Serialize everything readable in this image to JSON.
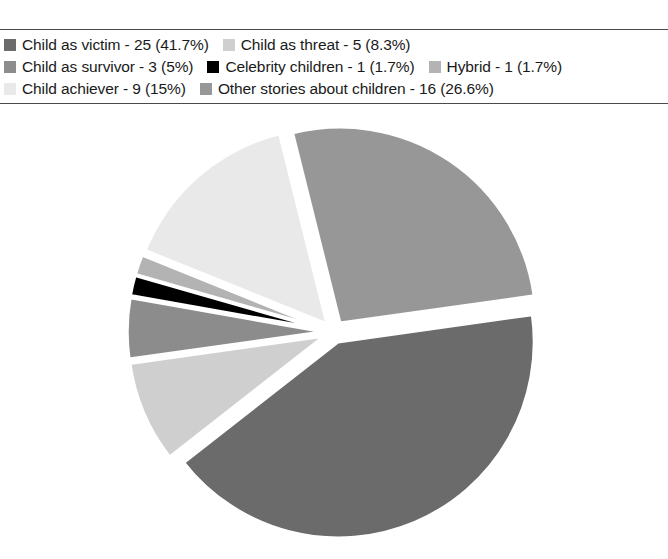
{
  "chart_data": {
    "type": "pie",
    "title": "",
    "subtitle": "",
    "xlabel": "",
    "ylabel": "",
    "legend_position": "top",
    "grid": false,
    "total": 60,
    "exploded": true,
    "start_angle_deg": -8,
    "categories": [
      "Child as victim",
      "Child as threat",
      "Child as survivor",
      "Celebrity children",
      "Hybrid",
      "Child achiever",
      "Other stories about children"
    ],
    "values": [
      25,
      5,
      3,
      1,
      1,
      9,
      16
    ],
    "percentages": [
      41.7,
      8.3,
      5.0,
      1.7,
      1.7,
      15.0,
      26.6
    ],
    "colors": [
      "#6b6b6b",
      "#cfcfcf",
      "#8c8c8c",
      "#000000",
      "#b3b3b3",
      "#e9e9e9",
      "#979797"
    ],
    "slices": [
      {
        "label": "Child as victim",
        "value": 25,
        "percent": 41.7,
        "color": "#6b6b6b",
        "explode": 0.055
      },
      {
        "label": "Child as threat",
        "value": 5,
        "percent": 8.3,
        "color": "#cfcfcf",
        "explode": 0.055
      },
      {
        "label": "Child as survivor",
        "value": 3,
        "percent": 5.0,
        "color": "#8c8c8c",
        "explode": 0.055
      },
      {
        "label": "Celebrity children",
        "value": 1,
        "percent": 1.7,
        "color": "#000000",
        "explode": 0.055
      },
      {
        "label": "Hybrid",
        "value": 1,
        "percent": 1.7,
        "color": "#b3b3b3",
        "explode": 0.055
      },
      {
        "label": "Child achiever",
        "value": 9,
        "percent": 15.0,
        "color": "#e9e9e9",
        "explode": 0.055
      },
      {
        "label": "Other stories about children",
        "value": 16,
        "percent": 26.6,
        "color": "#979797",
        "explode": 0.055
      }
    ]
  },
  "legend": {
    "rows": [
      [
        {
          "text": "Child as victim - 25 (41.7%)",
          "color": "#6b6b6b",
          "index": 0
        },
        {
          "text": "Child as threat - 5 (8.3%)",
          "color": "#cfcfcf",
          "index": 1
        }
      ],
      [
        {
          "text": "Child as survivor - 3 (5%)",
          "color": "#8c8c8c",
          "index": 2
        },
        {
          "text": "Celebrity children - 1 (1.7%)",
          "color": "#000000",
          "index": 3
        },
        {
          "text": "Hybrid - 1 (1.7%)",
          "color": "#b3b3b3",
          "index": 4
        }
      ],
      [
        {
          "text": "Child achiever - 9 (15%)",
          "color": "#e9e9e9",
          "index": 5
        },
        {
          "text": "Other stories about children - 16 (26.6%)",
          "color": "#979797",
          "index": 6
        }
      ]
    ]
  }
}
